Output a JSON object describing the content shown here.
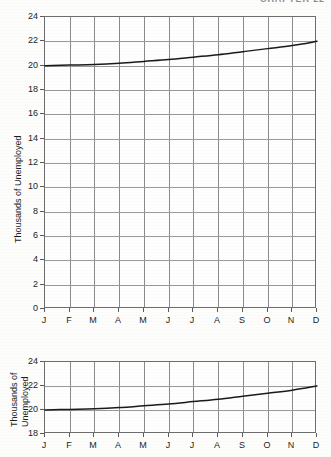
{
  "page": {
    "running_head": "CHAPTER 22"
  },
  "chart_data": [
    {
      "id": "full-scale-chart",
      "type": "line",
      "title": "",
      "xlabel": "",
      "ylabel": "Thousands of Unemployed",
      "categories": [
        "J",
        "F",
        "M",
        "A",
        "M",
        "J",
        "J",
        "A",
        "S",
        "O",
        "N",
        "D"
      ],
      "values": [
        20.0,
        20.05,
        20.1,
        20.2,
        20.35,
        20.5,
        20.7,
        20.9,
        21.15,
        21.4,
        21.65,
        22.0
      ],
      "ylim": [
        0,
        24
      ],
      "yticks": [
        0,
        2,
        4,
        6,
        8,
        10,
        12,
        14,
        16,
        18,
        20,
        22,
        24
      ],
      "ytick_labels": [
        "0",
        "2",
        "4",
        "6",
        "8",
        "10",
        "12",
        "14",
        "16",
        "18",
        "20",
        "22",
        "24"
      ],
      "grid": true,
      "legend": "none",
      "line_color": "#1a1a1a"
    },
    {
      "id": "truncated-scale-chart",
      "type": "line",
      "title": "",
      "xlabel": "",
      "ylabel": "Thousands of\nUnemployed",
      "ylabel_line1": "Thousands of",
      "ylabel_line2": "Unemployed",
      "categories": [
        "J",
        "F",
        "M",
        "A",
        "M",
        "J",
        "J",
        "A",
        "S",
        "O",
        "N",
        "D"
      ],
      "values": [
        20.0,
        20.05,
        20.1,
        20.2,
        20.35,
        20.5,
        20.7,
        20.9,
        21.15,
        21.4,
        21.65,
        22.0
      ],
      "ylim": [
        18,
        24
      ],
      "yticks": [
        18,
        20,
        22,
        24
      ],
      "ytick_labels": [
        "18",
        "20",
        "22",
        "24"
      ],
      "grid": true,
      "legend": "none",
      "line_color": "#1a1a1a"
    }
  ]
}
